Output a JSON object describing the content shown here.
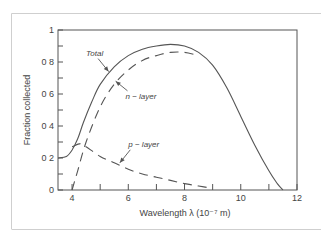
{
  "chart_data": {
    "type": "line",
    "title": "",
    "xlabel": "Wavelength λ (10⁻⁷ m)",
    "ylabel": "Fraction collected",
    "xlim": [
      3.5,
      12
    ],
    "ylim": [
      0,
      1
    ],
    "x_ticks": [
      4,
      6,
      8,
      10,
      12
    ],
    "x_minor_ticks": [
      5,
      7,
      9,
      11
    ],
    "y_ticks": [
      0,
      0.2,
      0.4,
      0.6,
      0.8,
      1
    ],
    "y_tick_labels": [
      "0",
      "0 2",
      "0 4",
      "0 6",
      "0 8",
      "1"
    ],
    "y_minor_ticks": [
      0.1,
      0.3,
      0.5,
      0.7,
      0.9
    ],
    "grid": false,
    "legend": null,
    "series": [
      {
        "name": "Total",
        "style": "solid",
        "x": [
          3.5,
          3.8,
          4.0,
          4.2,
          4.4,
          4.7,
          5.0,
          5.5,
          6.0,
          6.5,
          7.0,
          7.5,
          8.0,
          8.5,
          9.0,
          9.5,
          10.0,
          10.5,
          11.0,
          11.3,
          11.5
        ],
        "y": [
          0.2,
          0.21,
          0.25,
          0.32,
          0.42,
          0.55,
          0.66,
          0.77,
          0.84,
          0.88,
          0.9,
          0.91,
          0.9,
          0.86,
          0.78,
          0.64,
          0.46,
          0.28,
          0.12,
          0.04,
          0.0
        ]
      },
      {
        "name": "n-layer",
        "style": "dashed",
        "x": [
          4.0,
          4.2,
          4.5,
          5.0,
          5.5,
          6.0,
          6.5,
          7.0,
          7.5,
          8.0,
          8.5
        ],
        "y": [
          0.0,
          0.12,
          0.3,
          0.52,
          0.66,
          0.75,
          0.81,
          0.84,
          0.86,
          0.86,
          0.84
        ]
      },
      {
        "name": "p-layer",
        "style": "dashed",
        "x": [
          4.0,
          4.3,
          4.5,
          5.0,
          5.5,
          6.0,
          6.5,
          7.0,
          7.5,
          8.0,
          8.5,
          9.0
        ],
        "y": [
          0.27,
          0.29,
          0.27,
          0.21,
          0.17,
          0.13,
          0.1,
          0.08,
          0.06,
          0.04,
          0.025,
          0.01
        ]
      }
    ],
    "annotations": [
      {
        "text": "Total",
        "text_x": 4.5,
        "text_y": 0.84,
        "arrow_to_x": 5.3,
        "arrow_to_y": 0.74
      },
      {
        "text": "n − layer",
        "text_x": 5.9,
        "text_y": 0.57,
        "arrow_to_x": 5.55,
        "arrow_to_y": 0.68
      },
      {
        "text": "p − layer",
        "text_x": 6.0,
        "text_y": 0.27,
        "arrow_to_x": 5.7,
        "arrow_to_y": 0.17
      }
    ]
  },
  "colors": {
    "line": "#555555",
    "axis": "#555555",
    "frame": "#cccccc"
  }
}
